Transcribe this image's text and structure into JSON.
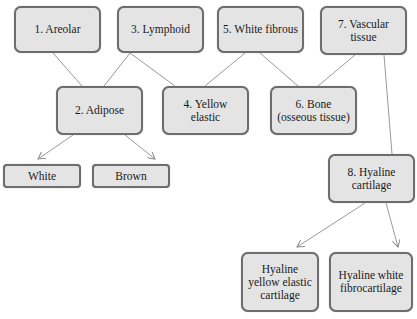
{
  "diagram": {
    "nodes": [
      {
        "id": "areolar",
        "label": "1. Areolar"
      },
      {
        "id": "adipose",
        "label": "2. Adipose"
      },
      {
        "id": "lymphoid",
        "label": "3. Lymphoid"
      },
      {
        "id": "yellow_elastic",
        "label": "4. Yellow elastic"
      },
      {
        "id": "white_fibrous",
        "label": "5. White fibrous"
      },
      {
        "id": "bone",
        "label": "6. Bone\n(osseous tissue)"
      },
      {
        "id": "vascular",
        "label": "7. Vascular\ntissue"
      },
      {
        "id": "hyaline",
        "label": "8. Hyaline\ncartilage"
      },
      {
        "id": "white",
        "label": "White"
      },
      {
        "id": "brown",
        "label": "Brown"
      },
      {
        "id": "hyaline_yellow",
        "label": "Hyaline\nyellow elastic\ncartilage"
      },
      {
        "id": "hyaline_white",
        "label": "Hyaline white\nfibrocartilage"
      }
    ],
    "edges": [
      {
        "from": "areolar",
        "to": "adipose",
        "arrow": false
      },
      {
        "from": "lymphoid",
        "to": "adipose",
        "arrow": false
      },
      {
        "from": "lymphoid",
        "to": "yellow_elastic",
        "arrow": false
      },
      {
        "from": "white_fibrous",
        "to": "yellow_elastic",
        "arrow": false
      },
      {
        "from": "white_fibrous",
        "to": "bone",
        "arrow": false
      },
      {
        "from": "vascular",
        "to": "bone",
        "arrow": false
      },
      {
        "from": "vascular",
        "to": "hyaline",
        "arrow": false
      },
      {
        "from": "adipose",
        "to": "white",
        "arrow": true
      },
      {
        "from": "adipose",
        "to": "brown",
        "arrow": true
      },
      {
        "from": "hyaline",
        "to": "hyaline_yellow",
        "arrow": true
      },
      {
        "from": "hyaline",
        "to": "hyaline_white",
        "arrow": true
      }
    ],
    "colors": {
      "node_fill": "#e4e4e4",
      "node_border": "#6d6d6d",
      "edge": "#8a8a8a"
    }
  }
}
